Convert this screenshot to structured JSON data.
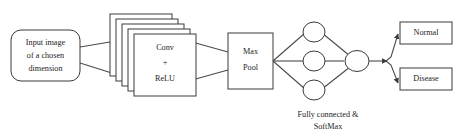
{
  "diagram": {
    "type": "flow-diagram",
    "background_color": "#ffffff",
    "stroke_color": "#3a3a3a",
    "text_color": "#1d1d1d",
    "nodes": {
      "input": {
        "shape": "rounded-rectangle",
        "line1": "Input image",
        "line2": "of a chosen",
        "line3": "dimension"
      },
      "conv": {
        "shape": "stacked-rectangle",
        "stack_count": 5,
        "line1": "Conv",
        "line2": "+",
        "line3": "ReLU"
      },
      "maxpool": {
        "shape": "rectangle",
        "line1": "Max",
        "line2": "Pool"
      },
      "fc": {
        "shape": "circles",
        "hidden_count": 3,
        "output_count": 1,
        "caption_line1": "Fully connected &",
        "caption_line2": "SoftMax"
      },
      "normal": {
        "shape": "rectangle",
        "label": "Normal"
      },
      "disease": {
        "shape": "rectangle",
        "label": "Disease"
      }
    }
  }
}
